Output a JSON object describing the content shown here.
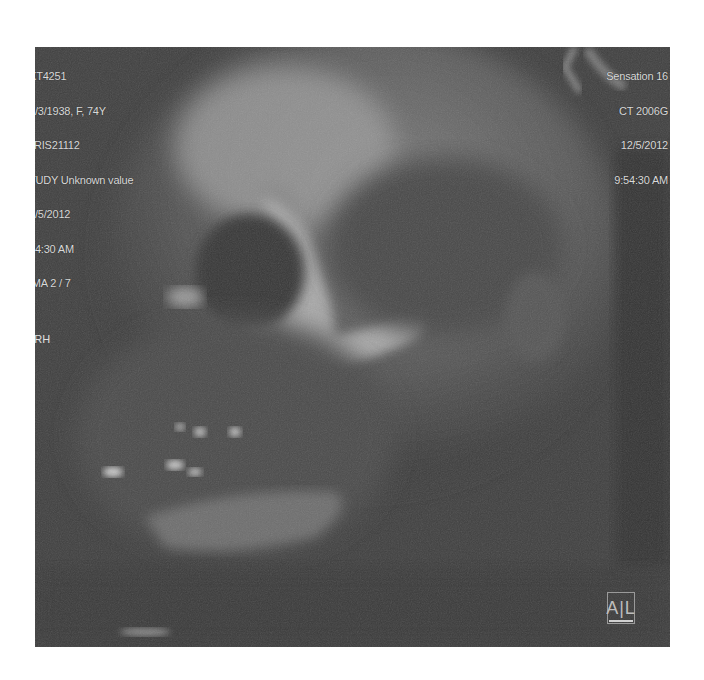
{
  "viewer": {
    "modality": "CT volume rendering",
    "top_left": {
      "patient_id": "XT4251",
      "dob_sex_age": "2/3/1938, F, 74Y",
      "accession": "RIS21112",
      "study": "TUDY Unknown value",
      "date": "2/5/2012",
      "time": "54:30 AM",
      "image_index": "IMA 2 / 7"
    },
    "top_right": {
      "scanner": "Sensation 16",
      "software": "CT 2006G",
      "date": "12/5/2012",
      "time": "9:54:30 AM"
    },
    "orientation": {
      "left_label": "ARH",
      "right_label": "P"
    },
    "orientation_cube_label": "A|L",
    "colors": {
      "background": "#ffffff",
      "viewport": "#3d3d3d",
      "overlay_text": "#d9d9d9"
    }
  }
}
